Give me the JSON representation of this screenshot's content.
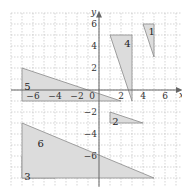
{
  "diagram": {
    "origin_px": [
      99,
      90
    ],
    "unit_px": 11,
    "axes": {
      "x_label": "x",
      "y_label": "y"
    },
    "x_ticks": [
      {
        "v": -6,
        "text": "−6"
      },
      {
        "v": -4,
        "text": "−4"
      },
      {
        "v": -2,
        "text": "−2"
      },
      {
        "v": 2,
        "text": "2"
      },
      {
        "v": 4,
        "text": "4"
      },
      {
        "v": 6,
        "text": "6"
      }
    ],
    "y_ticks": [
      {
        "v": 6,
        "text": "6"
      },
      {
        "v": 4,
        "text": "4"
      },
      {
        "v": 2,
        "text": "2"
      },
      {
        "v": -2,
        "text": "−2"
      },
      {
        "v": -4,
        "text": "−4"
      },
      {
        "v": -6,
        "text": "−6"
      }
    ],
    "origin_label": "0",
    "triangles": [
      {
        "label": "1",
        "points": [
          [
            4,
            6
          ],
          [
            5,
            6
          ],
          [
            5,
            3
          ]
        ],
        "label_at": [
          4.5,
          5.3
        ]
      },
      {
        "label": "2",
        "points": [
          [
            1,
            -2
          ],
          [
            1,
            -3
          ],
          [
            4,
            -3
          ]
        ],
        "label_at": [
          1.2,
          -2.9
        ]
      },
      {
        "label": "3",
        "points": [
          [
            -7,
            -6
          ],
          [
            -7,
            -8
          ],
          [
            -4,
            -8
          ]
        ],
        "label_at": [
          -6.8,
          -7.9
        ]
      },
      {
        "label": "4",
        "points": [
          [
            1,
            5
          ],
          [
            3,
            5
          ],
          [
            3,
            -1
          ]
        ],
        "label_at": [
          2.3,
          4.2
        ]
      },
      {
        "label": "5",
        "points": [
          [
            -7,
            2
          ],
          [
            -7,
            -1
          ],
          [
            2,
            -1
          ]
        ],
        "label_at": [
          -6.8,
          0.3
        ]
      },
      {
        "label": "6",
        "points": [
          [
            -7,
            -3
          ],
          [
            -7,
            -8
          ],
          [
            5,
            -8
          ]
        ],
        "label_at": [
          -5.6,
          -4.9
        ]
      }
    ]
  }
}
